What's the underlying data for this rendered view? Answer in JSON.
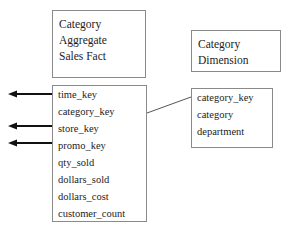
{
  "diagram": {
    "type": "star-schema-er-diagram",
    "background_color": "#ffffff",
    "line_color": "#111111",
    "border_color": "#8a8a8a",
    "text_color": "#1d1d1d"
  },
  "fact_table": {
    "title_lines": [
      "Category",
      "Aggregate",
      "Sales Fact"
    ],
    "fields": [
      {
        "name": "time_key",
        "has_arrow": true
      },
      {
        "name": "category_key",
        "has_arrow": false
      },
      {
        "name": "store_key",
        "has_arrow": true
      },
      {
        "name": "promo_key",
        "has_arrow": true
      },
      {
        "name": "qty_sold",
        "has_arrow": false
      },
      {
        "name": "dollars_sold",
        "has_arrow": false
      },
      {
        "name": "dollars_cost",
        "has_arrow": false
      },
      {
        "name": "customer_count",
        "has_arrow": false
      }
    ]
  },
  "dimension_table": {
    "title_lines": [
      "Category",
      "Dimension"
    ],
    "fields": [
      "category_key",
      "category",
      "department"
    ]
  },
  "connectors": {
    "outbound_arrows": [
      "time_key",
      "store_key",
      "promo_key"
    ],
    "join": {
      "from": "category_key",
      "to": "category_key"
    }
  }
}
